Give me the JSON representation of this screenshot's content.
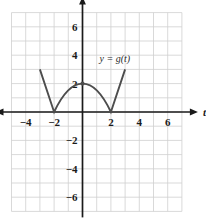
{
  "chart_data": {
    "type": "line",
    "title": "",
    "xlabel": "t",
    "ylabel": "y",
    "xlim": [
      -5,
      7
    ],
    "ylim": [
      -7,
      7
    ],
    "grid": true,
    "grid_step": 1,
    "x_tick_labels": [
      "-4",
      "-2",
      "2",
      "4",
      "6"
    ],
    "x_tick_values": [
      -4,
      -2,
      2,
      4,
      6
    ],
    "y_tick_labels": [
      "6",
      "4",
      "2",
      "-2",
      "-4",
      "-6"
    ],
    "y_tick_values": [
      6,
      4,
      2,
      -2,
      -4,
      -6
    ],
    "legend_position": "inline-annotation",
    "annotations": [
      {
        "text": "y = g(t)",
        "x": 1.2,
        "y": 3.5
      }
    ],
    "series": [
      {
        "name": "y = g(t)",
        "color": "#4d4d4d",
        "points": [
          {
            "x": -3,
            "y": 3
          },
          {
            "x": -2,
            "y": 0
          },
          {
            "x": -1.2,
            "y": 1.35
          },
          {
            "x": 0,
            "y": 2
          },
          {
            "x": 1.2,
            "y": 1.35
          },
          {
            "x": 2,
            "y": 0
          },
          {
            "x": 3,
            "y": 3
          }
        ],
        "markers": [
          {
            "x": 0,
            "y": 2
          }
        ]
      }
    ],
    "colors": {
      "grid": "#cfcfcf",
      "axis": "#1a1a1a",
      "curve": "#4d4d4d",
      "background": "#ffffff"
    }
  }
}
